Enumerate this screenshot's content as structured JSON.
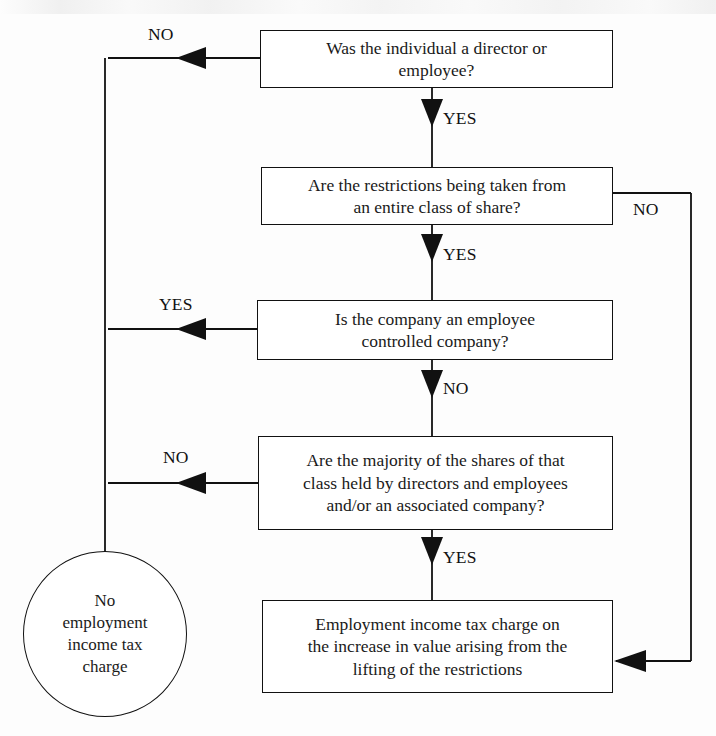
{
  "diagram": {
    "stroke_color": "#111111",
    "fill_color": "#ffffff",
    "background_color": "#fdfdfd"
  },
  "nodes": {
    "q1": {
      "id": "q1",
      "shape": "rectangle",
      "line1": "Was the individual a director or",
      "line2": "employee?",
      "text": "Was the individual a director or employee?"
    },
    "q2": {
      "id": "q2",
      "shape": "rectangle",
      "line1": "Are the restrictions being taken from",
      "line2": "an entire class of share?",
      "text": "Are the restrictions being taken from an entire class of share?"
    },
    "q3": {
      "id": "q3",
      "shape": "rectangle",
      "line1": "Is the company an employee",
      "line2": "controlled company?",
      "text": "Is the company an employee controlled company?"
    },
    "q4": {
      "id": "q4",
      "shape": "rectangle",
      "line1": "Are the majority of the shares of that",
      "line2": "class held by directors and employees",
      "line3": "and/or an associated company?",
      "text": "Are the majority of the shares of that class held by directors and employees and/or an associated company?"
    },
    "outcome_charge": {
      "id": "outcome_charge",
      "shape": "rectangle",
      "line1": "Employment income tax charge on",
      "line2": "the increase in value arising from the",
      "line3": "lifting of the restrictions",
      "text": "Employment income tax charge on the increase in value arising from the lifting of the restrictions"
    },
    "outcome_no_charge": {
      "id": "outcome_no_charge",
      "shape": "circle",
      "line1": "No",
      "line2": "employment",
      "line3": "income tax",
      "line4": "charge",
      "text": "No employment income tax charge"
    }
  },
  "edge_labels": {
    "q1_no": "NO",
    "q1_yes": "YES",
    "q2_no": "NO",
    "q2_yes": "YES",
    "q3_yes": "YES",
    "q3_no": "NO",
    "q4_no": "NO",
    "q4_yes": "YES"
  },
  "edges": [
    {
      "from": "q1",
      "to": "outcome_no_charge",
      "label": "NO",
      "direction": "left"
    },
    {
      "from": "q1",
      "to": "q2",
      "label": "YES",
      "direction": "down"
    },
    {
      "from": "q2",
      "to": "outcome_charge",
      "label": "NO",
      "direction": "right"
    },
    {
      "from": "q2",
      "to": "q3",
      "label": "YES",
      "direction": "down"
    },
    {
      "from": "q3",
      "to": "outcome_no_charge",
      "label": "YES",
      "direction": "left"
    },
    {
      "from": "q3",
      "to": "q4",
      "label": "NO",
      "direction": "down"
    },
    {
      "from": "q4",
      "to": "outcome_no_charge",
      "label": "NO",
      "direction": "left"
    },
    {
      "from": "q4",
      "to": "outcome_charge",
      "label": "YES",
      "direction": "down"
    }
  ]
}
